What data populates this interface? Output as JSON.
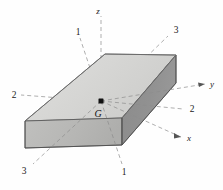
{
  "figure": {
    "background_color": "#fefefe"
  },
  "body_solid": {
    "name": "rectangular-block",
    "faces": {
      "top": {
        "label": "top-face",
        "color": "#d8d8d6"
      },
      "front_left": {
        "label": "front-left-face",
        "color": "#b9b9b7"
      },
      "front_right": {
        "label": "front-right-face",
        "color": "#8f8f8f"
      }
    },
    "edge_color": "#4a4a4a"
  },
  "center_of_mass": {
    "label": "G",
    "marker": "square-dot",
    "color": "#111111"
  },
  "axes": [
    {
      "id": "z",
      "label": "z",
      "line": "dashed"
    },
    {
      "id": "y",
      "label": "y",
      "line": "dashed"
    },
    {
      "id": "x",
      "label": "x",
      "line": "dashed"
    }
  ],
  "principal_axes": [
    {
      "id": "axis-1-top",
      "label": "1",
      "line": "dashed"
    },
    {
      "id": "axis-1-bottom",
      "label": "1",
      "line": "dashed"
    },
    {
      "id": "axis-2-left",
      "label": "2",
      "line": "dashed"
    },
    {
      "id": "axis-2-right",
      "label": "2",
      "line": "dashed"
    },
    {
      "id": "axis-3-top",
      "label": "3",
      "line": "dashed"
    },
    {
      "id": "axis-3-bottom",
      "label": "3",
      "line": "dashed"
    }
  ],
  "colors": {
    "dash_line": "#8d8d8d",
    "axis_line": "#555555",
    "ink": "#1a1a1a"
  }
}
